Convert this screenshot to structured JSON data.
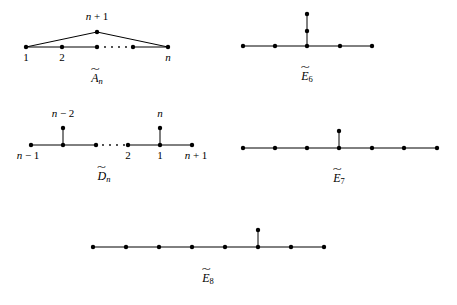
{
  "page": {
    "width": 457,
    "height": 305,
    "background": "#ffffff",
    "ink": "#000000"
  },
  "diagrams": [
    {
      "id": "a-tilde-n",
      "caption_base": "A",
      "caption_sub": "n",
      "caption_x": 97,
      "caption_y": 70,
      "node_radius": 2.2,
      "nodes": [
        {
          "name": "apex-node",
          "x": 97,
          "y": 32
        },
        {
          "name": "node-1",
          "x": 26,
          "y": 47
        },
        {
          "name": "node-2",
          "x": 62,
          "y": 47
        },
        {
          "name": "node-mid",
          "x": 97,
          "y": 47
        },
        {
          "name": "node-pre-n",
          "x": 133,
          "y": 47
        },
        {
          "name": "node-n",
          "x": 168,
          "y": 47
        }
      ],
      "edges": [
        {
          "x1": 26,
          "y1": 47,
          "x2": 97,
          "y2": 32
        },
        {
          "x1": 97,
          "y1": 32,
          "x2": 168,
          "y2": 47
        },
        {
          "x1": 26,
          "y1": 47,
          "x2": 97,
          "y2": 47
        },
        {
          "x1": 133,
          "y1": 47,
          "x2": 168,
          "y2": 47
        }
      ],
      "ellipsis": [
        {
          "x": 105,
          "y": 47
        },
        {
          "x": 112,
          "y": 47
        },
        {
          "x": 119,
          "y": 47
        },
        {
          "x": 126,
          "y": 47
        }
      ],
      "labels": [
        {
          "name": "label-n-plus-1",
          "text": "n + 1",
          "x": 97,
          "y": 11,
          "align": "center"
        },
        {
          "name": "label-1",
          "text": "1",
          "x": 26,
          "y": 52,
          "align": "center"
        },
        {
          "name": "label-2",
          "text": "2",
          "x": 62,
          "y": 52,
          "align": "center"
        },
        {
          "name": "label-n",
          "text": "n",
          "x": 168,
          "y": 52,
          "align": "center"
        }
      ]
    },
    {
      "id": "e-tilde-6",
      "caption_base": "E",
      "caption_sub": "6",
      "caption_x": 307,
      "caption_y": 68,
      "node_radius": 2.2,
      "nodes": [
        {
          "name": "node-left-end",
          "x": 243,
          "y": 46
        },
        {
          "name": "node-left-mid",
          "x": 275,
          "y": 46
        },
        {
          "name": "node-center",
          "x": 307,
          "y": 46
        },
        {
          "name": "node-right-mid",
          "x": 340,
          "y": 46
        },
        {
          "name": "node-right-end",
          "x": 372,
          "y": 46
        },
        {
          "name": "node-branch-lower",
          "x": 307,
          "y": 31
        },
        {
          "name": "node-branch-upper",
          "x": 307,
          "y": 14
        }
      ],
      "edges": [
        {
          "x1": 243,
          "y1": 46,
          "x2": 372,
          "y2": 46
        },
        {
          "x1": 307,
          "y1": 46,
          "x2": 307,
          "y2": 14
        }
      ],
      "ellipsis": [],
      "labels": []
    },
    {
      "id": "d-tilde-n",
      "caption_base": "D",
      "caption_sub": "n",
      "caption_x": 104,
      "caption_y": 168,
      "node_radius": 2.2,
      "nodes": [
        {
          "name": "node-n-minus-1",
          "x": 31,
          "y": 145
        },
        {
          "name": "node-branch-left-base",
          "x": 63,
          "y": 145
        },
        {
          "name": "node-n-minus-2",
          "x": 63,
          "y": 128
        },
        {
          "name": "node-after-branch",
          "x": 96,
          "y": 145
        },
        {
          "name": "node-2",
          "x": 128,
          "y": 145
        },
        {
          "name": "node-1",
          "x": 160,
          "y": 145
        },
        {
          "name": "node-n",
          "x": 160,
          "y": 128
        },
        {
          "name": "node-n-plus-1",
          "x": 192,
          "y": 145
        }
      ],
      "edges": [
        {
          "x1": 31,
          "y1": 145,
          "x2": 96,
          "y2": 145
        },
        {
          "x1": 128,
          "y1": 145,
          "x2": 192,
          "y2": 145
        },
        {
          "x1": 63,
          "y1": 145,
          "x2": 63,
          "y2": 128
        },
        {
          "x1": 160,
          "y1": 145,
          "x2": 160,
          "y2": 128
        }
      ],
      "ellipsis": [
        {
          "x": 103,
          "y": 145
        },
        {
          "x": 110,
          "y": 145
        },
        {
          "x": 117,
          "y": 145
        },
        {
          "x": 124,
          "y": 145
        }
      ],
      "labels": [
        {
          "name": "label-n-minus-2",
          "text": "n − 2",
          "x": 63,
          "y": 108,
          "align": "center"
        },
        {
          "name": "label-n",
          "text": "n",
          "x": 160,
          "y": 108,
          "align": "center"
        },
        {
          "name": "label-n-minus-1",
          "text": "n − 1",
          "x": 28,
          "y": 150,
          "align": "center"
        },
        {
          "name": "label-2",
          "text": "2",
          "x": 128,
          "y": 150,
          "align": "center"
        },
        {
          "name": "label-1",
          "text": "1",
          "x": 160,
          "y": 150,
          "align": "center"
        },
        {
          "name": "label-n-plus-1",
          "text": "n + 1",
          "x": 196,
          "y": 150,
          "align": "center"
        }
      ]
    },
    {
      "id": "e-tilde-7",
      "caption_base": "E",
      "caption_sub": "7",
      "caption_x": 339,
      "caption_y": 170,
      "node_radius": 2.2,
      "nodes": [
        {
          "name": "node-1",
          "x": 243,
          "y": 148
        },
        {
          "name": "node-2",
          "x": 275,
          "y": 148
        },
        {
          "name": "node-3",
          "x": 307,
          "y": 148
        },
        {
          "name": "node-center",
          "x": 339,
          "y": 148
        },
        {
          "name": "node-5",
          "x": 372,
          "y": 148
        },
        {
          "name": "node-6",
          "x": 404,
          "y": 148
        },
        {
          "name": "node-7",
          "x": 437,
          "y": 148
        },
        {
          "name": "node-branch",
          "x": 339,
          "y": 131
        }
      ],
      "edges": [
        {
          "x1": 243,
          "y1": 148,
          "x2": 437,
          "y2": 148
        },
        {
          "x1": 339,
          "y1": 148,
          "x2": 339,
          "y2": 131
        }
      ],
      "ellipsis": [],
      "labels": []
    },
    {
      "id": "e-tilde-8",
      "caption_base": "E",
      "caption_sub": "8",
      "caption_x": 208,
      "caption_y": 270,
      "node_radius": 2.2,
      "nodes": [
        {
          "name": "node-1",
          "x": 93,
          "y": 247
        },
        {
          "name": "node-2",
          "x": 126,
          "y": 247
        },
        {
          "name": "node-3",
          "x": 159,
          "y": 247
        },
        {
          "name": "node-4",
          "x": 192,
          "y": 247
        },
        {
          "name": "node-5",
          "x": 225,
          "y": 247
        },
        {
          "name": "node-center",
          "x": 258,
          "y": 247
        },
        {
          "name": "node-7",
          "x": 291,
          "y": 247
        },
        {
          "name": "node-8",
          "x": 324,
          "y": 247
        },
        {
          "name": "node-branch",
          "x": 258,
          "y": 230
        }
      ],
      "edges": [
        {
          "x1": 93,
          "y1": 247,
          "x2": 324,
          "y2": 247
        },
        {
          "x1": 258,
          "y1": 247,
          "x2": 258,
          "y2": 230
        }
      ],
      "ellipsis": [],
      "labels": []
    }
  ]
}
